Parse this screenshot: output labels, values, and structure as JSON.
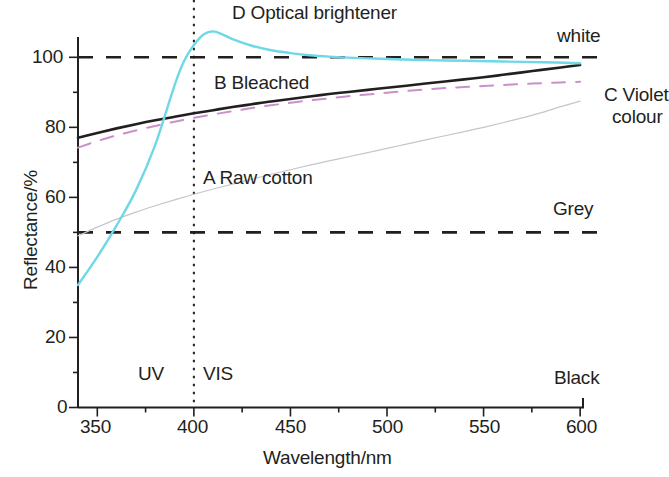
{
  "chart_data": {
    "type": "line",
    "title": "",
    "xlabel": "Wavelength/nm",
    "ylabel": "Reflectance/%",
    "xlim": [
      340,
      602
    ],
    "ylim": [
      0,
      113
    ],
    "xticks": [
      350,
      375,
      400,
      425,
      450,
      475,
      500,
      525,
      550,
      575,
      600
    ],
    "xticklabels": [
      "350",
      "",
      "400",
      "",
      "450",
      "",
      "500",
      "",
      "550",
      "",
      "600"
    ],
    "yticks": [
      0,
      10,
      20,
      30,
      40,
      50,
      60,
      70,
      80,
      90,
      100
    ],
    "yticklabels": [
      "0",
      "",
      "20",
      "",
      "40",
      "",
      "60",
      "",
      "80",
      "",
      "100"
    ],
    "grid": false,
    "legend_position": "inline-annotations",
    "series": [
      {
        "name": "A Raw cotton",
        "label": "A Raw cotton",
        "color": "#c8c3cc",
        "style": "solid",
        "width": 1.2,
        "x": [
          340,
          350,
          360,
          370,
          380,
          390,
          400,
          410,
          420,
          430,
          440,
          450,
          460,
          470,
          480,
          490,
          500,
          510,
          520,
          530,
          540,
          550,
          560,
          570,
          580,
          590,
          600
        ],
        "y": [
          49.0,
          51.5,
          53.8,
          55.8,
          57.6,
          59.3,
          60.9,
          62.4,
          63.8,
          65.2,
          66.6,
          67.9,
          69.2,
          70.4,
          71.6,
          72.8,
          74.0,
          75.2,
          76.4,
          77.6,
          78.8,
          80.0,
          81.3,
          82.7,
          84.2,
          85.9,
          87.5
        ]
      },
      {
        "name": "B Bleached",
        "label": "B Bleached",
        "color": "#231f20",
        "style": "solid",
        "width": 2.6,
        "x": [
          340,
          350,
          360,
          370,
          380,
          390,
          400,
          410,
          420,
          430,
          440,
          450,
          460,
          470,
          480,
          490,
          500,
          510,
          520,
          530,
          540,
          550,
          560,
          570,
          580,
          590,
          600
        ],
        "y": [
          77.0,
          78.4,
          79.7,
          80.9,
          82.0,
          83.0,
          84.0,
          84.9,
          85.8,
          86.6,
          87.4,
          88.1,
          88.8,
          89.5,
          90.1,
          90.7,
          91.3,
          91.9,
          92.5,
          93.1,
          93.7,
          94.3,
          95.0,
          95.7,
          96.4,
          97.1,
          97.8
        ]
      },
      {
        "name": "C Violet colour",
        "label": "C Violet colour",
        "color": "#cc8fcc",
        "style": "dashed",
        "width": 2.0,
        "x": [
          340,
          350,
          360,
          370,
          380,
          390,
          400,
          410,
          420,
          430,
          440,
          450,
          460,
          470,
          480,
          490,
          500,
          510,
          520,
          530,
          540,
          550,
          560,
          570,
          580,
          590,
          600
        ],
        "y": [
          74.2,
          76.1,
          77.7,
          79.1,
          80.4,
          81.6,
          82.7,
          83.7,
          84.6,
          85.5,
          86.3,
          87.0,
          87.7,
          88.3,
          88.9,
          89.4,
          89.9,
          90.4,
          90.8,
          91.2,
          91.5,
          91.8,
          92.1,
          92.4,
          92.6,
          92.8,
          93.0
        ]
      },
      {
        "name": "D Optical brightener",
        "label": "D Optical brightener",
        "color": "#6fd8e6",
        "style": "solid",
        "width": 2.4,
        "x": [
          340,
          350,
          360,
          370,
          380,
          390,
          395,
          400,
          405,
          410,
          415,
          420,
          430,
          440,
          450,
          460,
          470,
          480,
          490,
          500,
          520,
          540,
          560,
          580,
          600
        ],
        "y": [
          35.0,
          43.0,
          52.0,
          62.0,
          75.0,
          92.0,
          99.0,
          103.5,
          106.5,
          107.4,
          106.5,
          105.2,
          103.3,
          102.0,
          101.2,
          100.6,
          100.2,
          99.9,
          99.7,
          99.5,
          99.2,
          99.0,
          98.8,
          98.6,
          98.3
        ]
      }
    ],
    "reference_lines": [
      {
        "name": "white",
        "label": "white",
        "value": 100,
        "style": "dashed",
        "color": "#231f20",
        "width": 2.6
      },
      {
        "name": "Grey",
        "label": "Grey",
        "value": 50,
        "style": "dashed",
        "color": "#231f20",
        "width": 2.6
      },
      {
        "name": "Black",
        "label": "Black",
        "value": 0,
        "style": "none",
        "color": "#231f20",
        "width": 0
      }
    ],
    "vertical_divider": {
      "name": "uv-vis-boundary",
      "value": 400,
      "style": "dotted",
      "color": "#231f20",
      "width": 2.0
    },
    "zone_labels": [
      {
        "name": "UV",
        "label": "UV",
        "x": 377,
        "y": 12
      },
      {
        "name": "VIS",
        "label": "VIS",
        "x": 421,
        "y": 12
      }
    ],
    "annotations": [
      {
        "name": "D Optical brightener",
        "label": "D Optical brightener",
        "x": 420,
        "y": 112
      },
      {
        "name": "B Bleached",
        "label": "B Bleached",
        "x": 437,
        "y": 92
      },
      {
        "name": "A Raw cotton",
        "label": "A Raw cotton",
        "x": 452,
        "y": 67
      },
      {
        "name": "white",
        "label": "white",
        "x": 590,
        "y": 105
      },
      {
        "name": "C Violet colour",
        "label": "C Violet colour",
        "x": 608,
        "y": 91
      },
      {
        "name": "Grey",
        "label": "Grey",
        "x": 570,
        "y": 56
      },
      {
        "name": "Black",
        "label": "Black",
        "x": 580,
        "y": 7
      }
    ]
  },
  "labels": {
    "x_axis_title": "Wavelength/nm",
    "y_axis_title": "Reflectance/%",
    "xticks": [
      "350",
      "400",
      "450",
      "500",
      "550",
      "600"
    ],
    "yticks": [
      "0",
      "20",
      "40",
      "60",
      "80",
      "100"
    ],
    "series_a": "A Raw cotton",
    "series_b": "B Bleached",
    "series_c_line1": "C Violet",
    "series_c_line2": "colour",
    "series_d": "D Optical brightener",
    "ref_white": "white",
    "ref_grey": "Grey",
    "ref_black": "Black",
    "zone_uv": "UV",
    "zone_vis": "VIS"
  },
  "colors": {
    "axis": "#231f20",
    "raw_cotton": "#c8c3cc",
    "bleached": "#231f20",
    "violet": "#cc8fcc",
    "brightener": "#6fd8e6",
    "background": "#ffffff"
  }
}
